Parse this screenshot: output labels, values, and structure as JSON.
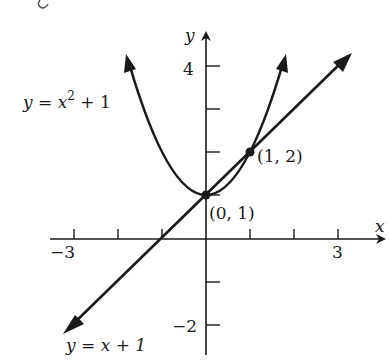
{
  "header_fragment": "(y = x + 1",
  "axes": {
    "x_label": "x",
    "y_label": "y",
    "x_ticks": [
      -3,
      -2,
      -1,
      1,
      2,
      3
    ],
    "x_tick_labels": {
      "neg3": "−3",
      "pos3": "3"
    },
    "y_ticks": [
      -2,
      -1,
      1,
      2,
      3,
      4
    ],
    "y_tick_labels": {
      "pos4": "4",
      "neg2": "−2"
    }
  },
  "curves": {
    "parabola": {
      "equation_lhs": "y = x",
      "exponent": "2",
      "equation_rhs": " + 1"
    },
    "line": {
      "equation": "y = x + 1"
    }
  },
  "points": {
    "p1": {
      "label": "(0, 1)"
    },
    "p2": {
      "label": "(1, 2)"
    }
  },
  "colors": {
    "ink": "#1a1a1a",
    "background": "#ffffff"
  }
}
